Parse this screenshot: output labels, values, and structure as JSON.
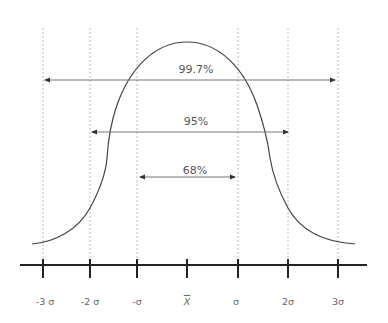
{
  "diagram": {
    "colors": {
      "curve": "#444444",
      "axis": "#222222",
      "guide": "#bbbbbb",
      "arrow": "#777777",
      "text": "#555555"
    },
    "ranges": [
      {
        "label": "99.7%",
        "from": "-3σ",
        "to": "3σ"
      },
      {
        "label": "95%",
        "from": "-2σ",
        "to": "2σ"
      },
      {
        "label": "68%",
        "from": "-σ",
        "to": "σ"
      }
    ],
    "axis_ticks": [
      {
        "label": "-3 σ"
      },
      {
        "label": "-2 σ"
      },
      {
        "label": "-σ"
      },
      {
        "label": "X"
      },
      {
        "label": "σ"
      },
      {
        "label": "2σ"
      },
      {
        "label": "3σ"
      }
    ]
  }
}
